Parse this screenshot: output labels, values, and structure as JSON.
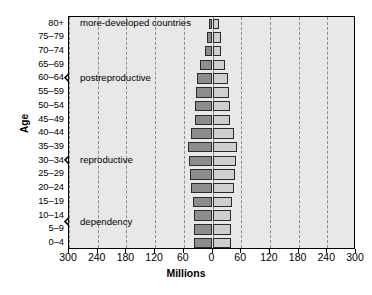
{
  "chart_data": {
    "type": "bar",
    "subtype": "population-pyramid",
    "title": "",
    "annotation_title": "more-developed countries",
    "xlabel": "Millions",
    "ylabel": "Age",
    "xlim": [
      -300,
      300
    ],
    "xticks": [
      300,
      240,
      180,
      120,
      60,
      0,
      60,
      120,
      180,
      240,
      300
    ],
    "xtick_values": [
      -300,
      -240,
      -180,
      -120,
      -60,
      0,
      60,
      120,
      180,
      240,
      300
    ],
    "grid": true,
    "grid_style": "dashed-vertical",
    "legend": "none",
    "categories": [
      "0–4",
      "5–9",
      "10–14",
      "15–19",
      "20–24",
      "25–29",
      "30–34",
      "35–39",
      "40–44",
      "45–49",
      "50–54",
      "55–59",
      "60–64",
      "65–69",
      "70–74",
      "75–79",
      "80+"
    ],
    "series": [
      {
        "name": "male",
        "side": "left",
        "color": "#8d8d8d",
        "values": [
          38,
          38,
          38,
          40,
          44,
          48,
          50,
          52,
          44,
          36,
          36,
          34,
          32,
          26,
          16,
          12,
          8
        ]
      },
      {
        "name": "female",
        "side": "right",
        "color": "#cfcfcf",
        "values": [
          38,
          38,
          38,
          40,
          44,
          48,
          50,
          52,
          44,
          36,
          36,
          34,
          32,
          26,
          18,
          18,
          14
        ]
      }
    ],
    "groups": [
      {
        "label": "more-developed countries",
        "from": "80+",
        "to": "80+",
        "brace": false
      },
      {
        "label": "postreproductive",
        "from": "45–49",
        "to": "75–79",
        "brace": true
      },
      {
        "label": "reproductive",
        "from": "20–24",
        "to": "40–44",
        "brace": true
      },
      {
        "label": "dependency",
        "from": "0–4",
        "to": "15–19",
        "brace": true
      }
    ]
  },
  "colors": {
    "plot_background": "#e8e8e8",
    "male_bar": "#8d8d8d",
    "female_bar": "#cfcfcf",
    "bar_border": "#2b2b2b",
    "gridline": "#8a8a8a",
    "axis": "#000000",
    "page_background": "#ffffff"
  }
}
